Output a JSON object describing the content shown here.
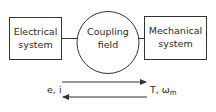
{
  "diagram": {
    "nodes": [
      {
        "id": "electrical",
        "shape": "rect",
        "lines": [
          "Electrical",
          "system"
        ]
      },
      {
        "id": "coupling",
        "shape": "circle",
        "lines": [
          "Coupling",
          "field"
        ]
      },
      {
        "id": "mechanical",
        "shape": "rect",
        "lines": [
          "Mechanical",
          "system"
        ]
      }
    ],
    "edges": [
      {
        "from": "electrical",
        "to": "coupling",
        "type": "line"
      },
      {
        "from": "coupling",
        "to": "mechanical",
        "type": "line"
      }
    ],
    "flow_arrows": [
      {
        "direction": "right"
      },
      {
        "direction": "left"
      }
    ],
    "electrical_variables": "e, i",
    "mechanical_variables_main": "T, ω",
    "mechanical_variables_subscript": "m"
  },
  "colors": {
    "stroke": "#333333",
    "text": "#2a2a2a",
    "background": "#ffffff"
  }
}
